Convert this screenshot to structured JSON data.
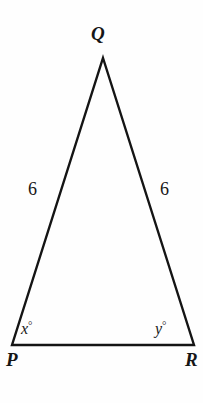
{
  "figure": {
    "type": "geometry-diagram",
    "shape": "isosceles-triangle",
    "background_color": "#fefefe",
    "stroke_color": "#141414",
    "stroke_width": 2.4,
    "text_color": "#161616",
    "width": 203,
    "height": 403
  },
  "vertices": {
    "Q": {
      "label": "Q",
      "x": 103,
      "y": 58,
      "label_x": 91,
      "label_y": 24
    },
    "P": {
      "label": "P",
      "x": 12,
      "y": 345,
      "label_x": 6,
      "label_y": 350
    },
    "R": {
      "label": "R",
      "x": 194,
      "y": 345,
      "label_x": 185,
      "label_y": 350
    }
  },
  "sides": {
    "PQ": {
      "label": "6",
      "label_x": 28,
      "label_y": 180
    },
    "QR": {
      "label": "6",
      "label_x": 160,
      "label_y": 180
    },
    "PR": {
      "label": ""
    }
  },
  "angles": {
    "at_P": {
      "variable": "x",
      "degree_symbol": "°",
      "label_x": 21,
      "label_y": 320
    },
    "at_R": {
      "variable": "y",
      "degree_symbol": "°",
      "label_x": 155,
      "label_y": 320
    }
  }
}
